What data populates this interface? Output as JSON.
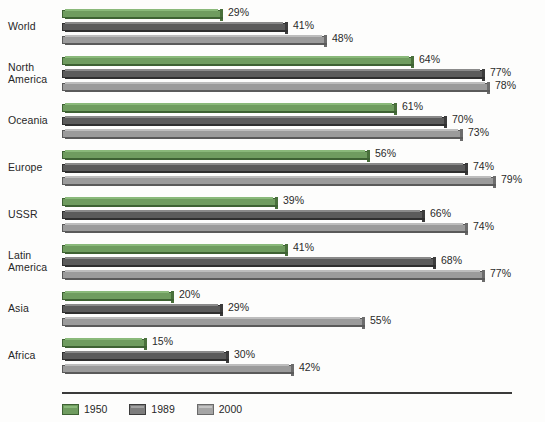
{
  "chart_data": {
    "type": "bar",
    "orientation": "horizontal",
    "title": "",
    "subtitle": "",
    "xlabel": "",
    "ylabel": "",
    "xlim": [
      0,
      80
    ],
    "grid": false,
    "value_suffix": "%",
    "legend_position": "bottom-left",
    "categories": [
      "World",
      "North America",
      "Oceania",
      "Europe",
      "USSR",
      "Latin America",
      "Asia",
      "Africa"
    ],
    "series": [
      {
        "name": "1950",
        "color": "#6f9c5f",
        "values": [
          29,
          64,
          61,
          56,
          39,
          41,
          20,
          15
        ]
      },
      {
        "name": "1989",
        "color": "#5b5b5b",
        "values": [
          41,
          77,
          70,
          74,
          66,
          68,
          29,
          30
        ]
      },
      {
        "name": "2000",
        "color": "#9b9b9b",
        "values": [
          48,
          78,
          73,
          79,
          74,
          77,
          55,
          42
        ]
      }
    ],
    "data_labels": [
      {
        "category": "World",
        "1950": "29%",
        "1989": "41%",
        "2000": "48%"
      },
      {
        "category": "North America",
        "1950": "64%",
        "1989": "77%",
        "2000": "78%"
      },
      {
        "category": "Oceania",
        "1950": "61%",
        "1989": "70%",
        "2000": "73%"
      },
      {
        "category": "Europe",
        "1950": "56%",
        "1989": "74%",
        "2000": "79%"
      },
      {
        "category": "USSR",
        "1950": "39%",
        "1989": "66%",
        "2000": "74%"
      },
      {
        "category": "Latin America",
        "1950": "41%",
        "1989": "68%",
        "2000": "77%"
      },
      {
        "category": "Asia",
        "1950": "20%",
        "1989": "29%",
        "2000": "55%"
      },
      {
        "category": "Africa",
        "1950": "15%",
        "1989": "30%",
        "2000": "42%"
      }
    ]
  },
  "legend": {
    "items": [
      {
        "label": "1950",
        "swatch": "c1950"
      },
      {
        "label": "1989",
        "swatch": "c1989"
      },
      {
        "label": "2000",
        "swatch": "c2000"
      }
    ]
  },
  "layout": {
    "bar_origin_x": 62,
    "px_per_percent": 5.45,
    "group_pitch": 47,
    "first_group_top": 8,
    "bar_pitch": 13
  }
}
